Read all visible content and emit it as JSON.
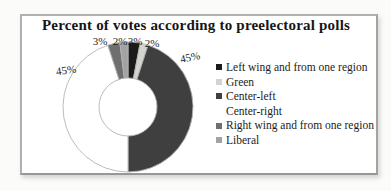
{
  "figure": {
    "background_color": "#fbfbfa",
    "frame_border_color": "#b0b0af"
  },
  "chart_data": {
    "type": "pie",
    "subtype": "doughnut",
    "title": "Percent of votes according to preelectoral polls",
    "legend_position": "right",
    "direction": "clockwise",
    "start_angle_deg": 0,
    "hole_ratio": 0.45,
    "series": [
      {
        "name": "Left wing and from one region",
        "value": 3,
        "label": "3%",
        "color": "#1b1b1b"
      },
      {
        "name": "Green",
        "value": 2,
        "label": "2%",
        "color": "#d3d3d0"
      },
      {
        "name": "Center-left",
        "value": 45,
        "label": "45%",
        "color": "#3f3f3f"
      },
      {
        "name": "Center-right",
        "value": 45,
        "label": "45%",
        "color": "#ffffff"
      },
      {
        "name": "Right wing and from one region",
        "value": 3,
        "label": "3%",
        "color": "#6f6f6f"
      },
      {
        "name": "Liberal",
        "value": 2,
        "label": "2%",
        "color": "#a3a3a1"
      }
    ]
  }
}
